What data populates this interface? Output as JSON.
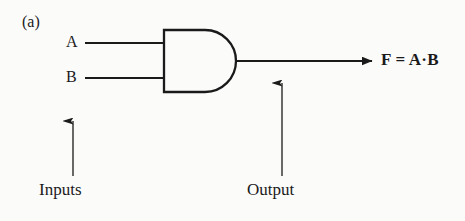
{
  "figure": {
    "panel_label": "(a)",
    "gate_type": "AND",
    "ink_color": "#1a1a1a",
    "background_color": "#fbfbfa"
  },
  "inputs": {
    "caption": "Inputs",
    "pins": [
      {
        "label": "A"
      },
      {
        "label": "B"
      }
    ]
  },
  "output": {
    "caption": "Output",
    "expression": "F = A·B"
  },
  "icons": {
    "and_gate": "and-gate-icon",
    "arrow_up": "arrow-up-icon",
    "arrow_right": "arrow-right-icon"
  }
}
